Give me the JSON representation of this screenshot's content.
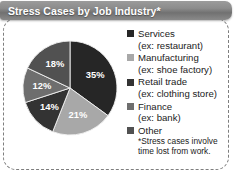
{
  "title": "Stress Cases by Job Industry*",
  "footnote": {
    "line1": "*Stress cases involve",
    "line2": "time lost from work."
  },
  "colors": {
    "title_bar": "#8c8c8c",
    "title_text": "#ffffff",
    "border": "#7e7e7e",
    "background": "#ffffff",
    "text": "#1b1b1b"
  },
  "legend": {
    "entries": [
      {
        "label": "Services",
        "sub": "(ex: restaurant)",
        "color": "#262626"
      },
      {
        "label": "Manufacturing",
        "sub": "(ex: shoe factory)",
        "color": "#a8a8a8"
      },
      {
        "label": "Retail trade",
        "sub": "(ex: clothing store)",
        "color": "#333333"
      },
      {
        "label": "Finance",
        "sub": "(ex: bank)",
        "color": "#6e6e6e"
      },
      {
        "label": "Other",
        "sub": "",
        "color": "#515151"
      }
    ]
  },
  "chart_data": {
    "type": "pie",
    "title": "Stress Cases by Job Industry*",
    "xlabel": "",
    "ylabel": "",
    "legend_position": "right",
    "grid": false,
    "start_angle_deg": 0,
    "direction": "clockwise",
    "categories": [
      "Services",
      "Manufacturing",
      "Retail trade",
      "Finance",
      "Other"
    ],
    "values": [
      35,
      21,
      14,
      12,
      18
    ],
    "value_labels": [
      "35%",
      "21%",
      "14%",
      "12%",
      "18%"
    ],
    "units": "percent",
    "slice_colors": [
      "#262626",
      "#a8a8a8",
      "#333333",
      "#6e6e6e",
      "#515151"
    ],
    "slice_label_colors": [
      "#ffffff",
      "#ffffff",
      "#ffffff",
      "#ffffff",
      "#ffffff"
    ],
    "annotations": [
      "*Stress cases involve time lost from work."
    ]
  }
}
